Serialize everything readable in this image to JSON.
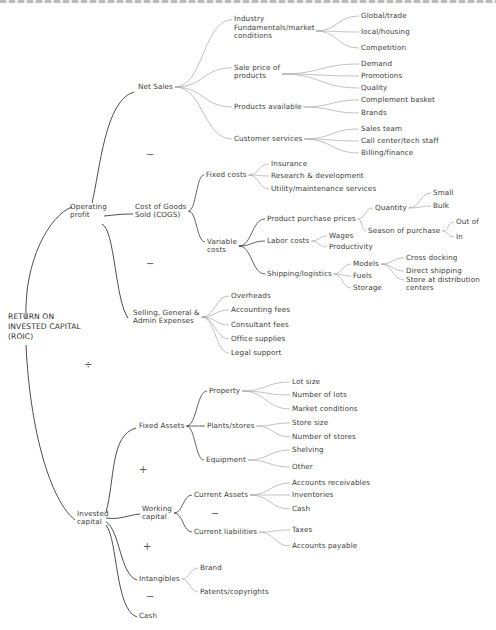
{
  "diagram": {
    "root": {
      "id": "roic",
      "label": "RETURN ON\nINVESTED CAPITAL\n(ROIC)",
      "x": 8,
      "y": 327
    },
    "root_operator": {
      "symbol": "÷",
      "x": 84,
      "y": 365
    },
    "nodes": [
      {
        "id": "op_profit",
        "label": "Operating\nprofit",
        "x": 70,
        "y": 211
      },
      {
        "id": "net_sales",
        "label": "Net Sales",
        "x": 138,
        "y": 87
      },
      {
        "id": "industry",
        "label": "Industry\nFundamentals/market\nconditions",
        "x": 234,
        "y": 28
      },
      {
        "id": "global",
        "label": "Global/trade",
        "x": 361,
        "y": 16
      },
      {
        "id": "local",
        "label": "local/housing",
        "x": 361,
        "y": 32
      },
      {
        "id": "competition",
        "label": "Competition",
        "x": 361,
        "y": 48
      },
      {
        "id": "sale_price",
        "label": "Sale price of\nproducts",
        "x": 234,
        "y": 72
      },
      {
        "id": "demand",
        "label": "Demand",
        "x": 361,
        "y": 64
      },
      {
        "id": "promotions",
        "label": "Promotions",
        "x": 361,
        "y": 76
      },
      {
        "id": "quality",
        "label": "Quality",
        "x": 361,
        "y": 88
      },
      {
        "id": "products_avail",
        "label": "Products available",
        "x": 234,
        "y": 107
      },
      {
        "id": "complement",
        "label": "Complement basket",
        "x": 361,
        "y": 100
      },
      {
        "id": "brands",
        "label": "Brands",
        "x": 361,
        "y": 113
      },
      {
        "id": "customer_services",
        "label": "Customer services",
        "x": 234,
        "y": 139
      },
      {
        "id": "sales_team",
        "label": "Sales team",
        "x": 361,
        "y": 129
      },
      {
        "id": "call_center",
        "label": "Call center/tech staff",
        "x": 361,
        "y": 141
      },
      {
        "id": "billing",
        "label": "Billing/finance",
        "x": 361,
        "y": 153
      },
      {
        "id": "cogs",
        "label": "Cost of Goods\nSold (COGS)",
        "x": 135,
        "y": 211
      },
      {
        "id": "fixed_costs",
        "label": "Fixed costs",
        "x": 206,
        "y": 175
      },
      {
        "id": "insurance",
        "label": "Insurance",
        "x": 271,
        "y": 164
      },
      {
        "id": "rnd",
        "label": "Research & development",
        "x": 271,
        "y": 176
      },
      {
        "id": "utility",
        "label": "Utility/maintenance services",
        "x": 271,
        "y": 189
      },
      {
        "id": "variable_costs",
        "label": "Variable\ncosts",
        "x": 207,
        "y": 246
      },
      {
        "id": "product_purchase",
        "label": "Product purchase prices",
        "x": 267,
        "y": 219
      },
      {
        "id": "quantity",
        "label": "Quantity",
        "x": 375,
        "y": 208
      },
      {
        "id": "small",
        "label": "Small",
        "x": 433,
        "y": 193
      },
      {
        "id": "bulk",
        "label": "Bulk",
        "x": 433,
        "y": 206
      },
      {
        "id": "season",
        "label": "Season of purchase",
        "x": 368,
        "y": 231
      },
      {
        "id": "out_of",
        "label": "Out of",
        "x": 456,
        "y": 222
      },
      {
        "id": "in",
        "label": "In",
        "x": 456,
        "y": 237
      },
      {
        "id": "labor",
        "label": "Labor costs",
        "x": 267,
        "y": 241
      },
      {
        "id": "wages",
        "label": "Wages",
        "x": 329,
        "y": 236
      },
      {
        "id": "productivity",
        "label": "Productivity",
        "x": 329,
        "y": 247
      },
      {
        "id": "shipping",
        "label": "Shipping/logistics",
        "x": 267,
        "y": 274
      },
      {
        "id": "models",
        "label": "Models",
        "x": 353,
        "y": 264
      },
      {
        "id": "fuels",
        "label": "Fuels",
        "x": 353,
        "y": 276
      },
      {
        "id": "storage",
        "label": "Storage",
        "x": 353,
        "y": 288
      },
      {
        "id": "cross_docking",
        "label": "Cross docking",
        "x": 406,
        "y": 258
      },
      {
        "id": "direct_shipping",
        "label": "Direct shipping",
        "x": 406,
        "y": 271
      },
      {
        "id": "store_dist",
        "label": "Store at distribution\ncenters",
        "x": 406,
        "y": 284
      },
      {
        "id": "sga",
        "label": "Selling, General &\nAdmin Expenses",
        "x": 133,
        "y": 317
      },
      {
        "id": "overheads",
        "label": "Overheads",
        "x": 231,
        "y": 296
      },
      {
        "id": "accounting",
        "label": "Accounting fees",
        "x": 231,
        "y": 310
      },
      {
        "id": "consultant",
        "label": "Consultant fees",
        "x": 231,
        "y": 325
      },
      {
        "id": "office",
        "label": "Office supplies",
        "x": 231,
        "y": 339
      },
      {
        "id": "legal",
        "label": "Legal support",
        "x": 231,
        "y": 353
      },
      {
        "id": "invested",
        "label": "Invested\ncapital",
        "x": 77,
        "y": 518
      },
      {
        "id": "fixed_assets",
        "label": "Fixed Assets",
        "x": 139,
        "y": 426
      },
      {
        "id": "property",
        "label": "Property",
        "x": 209,
        "y": 391
      },
      {
        "id": "lot_size",
        "label": "Lot size",
        "x": 292,
        "y": 382
      },
      {
        "id": "num_lots",
        "label": "Number of lots",
        "x": 292,
        "y": 395
      },
      {
        "id": "market_cond",
        "label": "Market conditions",
        "x": 292,
        "y": 409
      },
      {
        "id": "plants",
        "label": "Plants/stores",
        "x": 207,
        "y": 426
      },
      {
        "id": "store_size",
        "label": "Store size",
        "x": 292,
        "y": 423
      },
      {
        "id": "num_stores",
        "label": "Number of stores",
        "x": 292,
        "y": 437
      },
      {
        "id": "equipment",
        "label": "Equipment",
        "x": 206,
        "y": 460
      },
      {
        "id": "shelving",
        "label": "Shelving",
        "x": 292,
        "y": 450
      },
      {
        "id": "other",
        "label": "Other",
        "x": 292,
        "y": 467
      },
      {
        "id": "working",
        "label": "Working\ncapital",
        "x": 142,
        "y": 513
      },
      {
        "id": "current_assets",
        "label": "Current Assets",
        "x": 194,
        "y": 495
      },
      {
        "id": "acct_recv",
        "label": "Accounts receivables",
        "x": 292,
        "y": 483
      },
      {
        "id": "inventories",
        "label": "Inventories",
        "x": 292,
        "y": 495
      },
      {
        "id": "cash_ca",
        "label": "Cash",
        "x": 292,
        "y": 509
      },
      {
        "id": "current_liab",
        "label": "Current liabilities",
        "x": 194,
        "y": 532
      },
      {
        "id": "taxes",
        "label": "Taxes",
        "x": 292,
        "y": 530
      },
      {
        "id": "acct_pay",
        "label": "Accounts payable",
        "x": 292,
        "y": 546
      },
      {
        "id": "intangibles",
        "label": "Intangibles",
        "x": 139,
        "y": 579
      },
      {
        "id": "brand",
        "label": "Brand",
        "x": 200,
        "y": 568
      },
      {
        "id": "patents",
        "label": "Patents/copyrights",
        "x": 200,
        "y": 592
      },
      {
        "id": "cash",
        "label": "Cash",
        "x": 139,
        "y": 616
      }
    ],
    "operators": [
      {
        "symbol": "−",
        "x": 146,
        "y": 155,
        "between": "Net Sales / COGS"
      },
      {
        "symbol": "−",
        "x": 146,
        "y": 264,
        "between": "COGS / SG&A"
      },
      {
        "symbol": "+",
        "x": 139,
        "y": 470,
        "between": "Fixed Assets / Working capital"
      },
      {
        "symbol": "−",
        "x": 211,
        "y": 514,
        "between": "Current Assets / Current liabilities"
      },
      {
        "symbol": "+",
        "x": 143,
        "y": 547,
        "between": "Working capital / Intangibles"
      },
      {
        "symbol": "−",
        "x": 146,
        "y": 597,
        "between": "Intangibles / Cash"
      }
    ]
  },
  "colors": {
    "primary_line": "#3a3a3a",
    "secondary_line": "#a8a8a8",
    "text": "#3c3c3c",
    "background": "#ffffff"
  }
}
